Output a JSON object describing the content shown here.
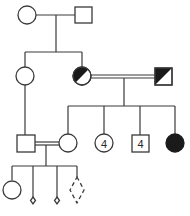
{
  "diagram": {
    "type": "pedigree",
    "colors": {
      "line": "#3a3a3a",
      "affected": "#1a1a1a",
      "background": "#ffffff"
    },
    "generations": [
      {
        "id": "I",
        "individuals": [
          {
            "id": "I-1",
            "sex": "female",
            "status": "unaffected"
          },
          {
            "id": "I-2",
            "sex": "male",
            "status": "unaffected"
          }
        ]
      },
      {
        "id": "II",
        "individuals": [
          {
            "id": "II-1",
            "sex": "female",
            "status": "unaffected"
          },
          {
            "id": "II-2",
            "sex": "female",
            "status": "carrier-half-filled"
          },
          {
            "id": "II-3",
            "sex": "male",
            "status": "carrier-diagonal-half-filled",
            "relationship": "consanguineous-with-II-2"
          }
        ]
      },
      {
        "id": "III",
        "individuals": [
          {
            "id": "III-1",
            "sex": "male",
            "status": "unaffected"
          },
          {
            "id": "III-2",
            "sex": "female",
            "status": "unaffected",
            "relationship": "consanguineous-with-III-1"
          },
          {
            "id": "III-3",
            "sex": "female",
            "status": "unaffected",
            "count_label": "4"
          },
          {
            "id": "III-4",
            "sex": "male",
            "status": "unaffected",
            "count_label": "4"
          },
          {
            "id": "III-5",
            "sex": "female",
            "status": "affected"
          }
        ]
      },
      {
        "id": "IV",
        "individuals": [
          {
            "id": "IV-1",
            "sex": "female",
            "status": "unaffected"
          },
          {
            "id": "IV-2",
            "sex": "unknown",
            "status": "miscarriage-small-diamond"
          },
          {
            "id": "IV-3",
            "sex": "unknown",
            "status": "miscarriage-small-diamond"
          },
          {
            "id": "IV-4",
            "sex": "unknown",
            "status": "pregnancy-dashed-diamond"
          }
        ]
      }
    ],
    "labels": {
      "sister_count": "4",
      "brother_count": "4"
    }
  }
}
